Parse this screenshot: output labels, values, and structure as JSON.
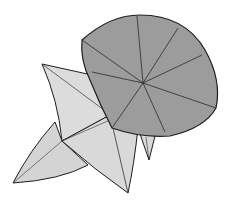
{
  "illustration": {
    "subject": "origami morning glory with leaf",
    "colors": {
      "background": "#ffffff",
      "flower_fill": "#9c9c9c",
      "leaf_fill": "#d9d9d9",
      "outline": "#1e1e1e",
      "crease": "#333333"
    }
  }
}
